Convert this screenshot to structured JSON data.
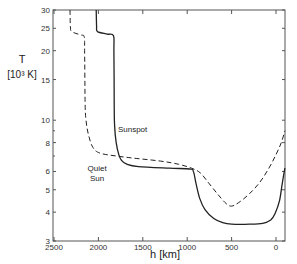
{
  "chart_data": {
    "type": "line",
    "title": "",
    "xlabel": "h [km]",
    "ylabel_line1": "T",
    "ylabel_line2": "[10³ K]",
    "xlim": [
      2500,
      -100
    ],
    "ylim": [
      3,
      30
    ],
    "yscale": "log",
    "grid": false,
    "x_ticks": [
      2500,
      2000,
      1500,
      1000,
      500,
      0
    ],
    "x_tick_labels": [
      "2500",
      "2000",
      "1500",
      "1000",
      "500",
      "0"
    ],
    "y_ticks": [
      3,
      4,
      5,
      6,
      8,
      10,
      15,
      20,
      25,
      30
    ],
    "y_tick_labels": [
      "3",
      "4",
      "5",
      "6",
      "8",
      "10",
      "15",
      "20",
      "25",
      "30"
    ],
    "y_minor_ticks": [
      7,
      9
    ],
    "series": [
      {
        "name": "Sunspot",
        "label_lines": [
          "Sunspot"
        ],
        "style": "solid",
        "points": [
          [
            2025,
            30
          ],
          [
            2020,
            25.5
          ],
          [
            2010,
            24.2
          ],
          [
            1900,
            23.6
          ],
          [
            1830,
            23.2
          ],
          [
            1825,
            20
          ],
          [
            1822,
            12
          ],
          [
            1818,
            9.5
          ],
          [
            1800,
            8
          ],
          [
            1770,
            7.1
          ],
          [
            1740,
            6.7
          ],
          [
            1680,
            6.45
          ],
          [
            1550,
            6.3
          ],
          [
            1200,
            6.2
          ],
          [
            970,
            6.15
          ],
          [
            930,
            6.0
          ],
          [
            900,
            5.3
          ],
          [
            860,
            4.6
          ],
          [
            800,
            4.1
          ],
          [
            700,
            3.75
          ],
          [
            600,
            3.6
          ],
          [
            500,
            3.55
          ],
          [
            300,
            3.55
          ],
          [
            150,
            3.58
          ],
          [
            60,
            3.7
          ],
          [
            10,
            3.95
          ],
          [
            -40,
            4.5
          ],
          [
            -70,
            5.3
          ],
          [
            -100,
            6.2
          ]
        ]
      },
      {
        "name": "Quiet Sun",
        "label_lines": [
          "Quiet",
          "Sun"
        ],
        "style": "dashed",
        "points": [
          [
            2320,
            30
          ],
          [
            2315,
            25.5
          ],
          [
            2300,
            24.2
          ],
          [
            2200,
            23.4
          ],
          [
            2160,
            23.0
          ],
          [
            2155,
            20
          ],
          [
            2150,
            12
          ],
          [
            2140,
            10
          ],
          [
            2110,
            8.6
          ],
          [
            2060,
            7.6
          ],
          [
            1980,
            7.2
          ],
          [
            1800,
            7.0
          ],
          [
            1600,
            6.85
          ],
          [
            1300,
            6.65
          ],
          [
            1100,
            6.45
          ],
          [
            950,
            6.2
          ],
          [
            850,
            5.9
          ],
          [
            750,
            5.3
          ],
          [
            650,
            4.75
          ],
          [
            560,
            4.35
          ],
          [
            500,
            4.25
          ],
          [
            420,
            4.4
          ],
          [
            300,
            4.8
          ],
          [
            180,
            5.4
          ],
          [
            80,
            6.2
          ],
          [
            0,
            7.1
          ],
          [
            -60,
            8.0
          ],
          [
            -100,
            9.0
          ]
        ]
      }
    ]
  }
}
